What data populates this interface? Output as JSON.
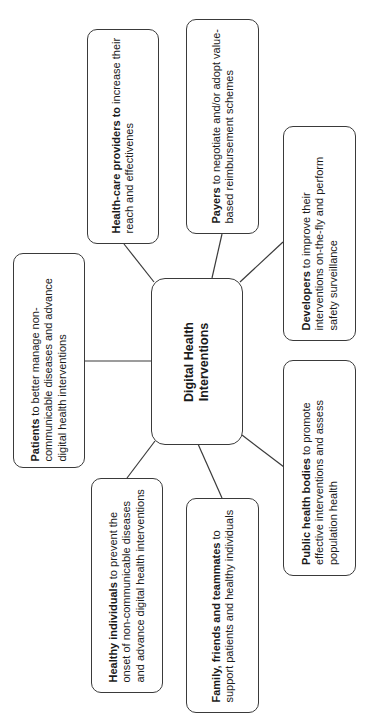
{
  "diagram": {
    "center": {
      "label": "Digital Health Interventions"
    },
    "stakeholders": [
      {
        "id": "patients",
        "bold": "Patients",
        "rest": " to better manage non-communicable diseases and advance digital health interventions"
      },
      {
        "id": "health-care-providers",
        "bold": "Health-care providers to",
        "rest": " increase their reach and effectivenes"
      },
      {
        "id": "payers",
        "bold": "Payers",
        "rest": " to negotiate and/or adopt value-based reimbursement schemes"
      },
      {
        "id": "developers",
        "bold": "Developers",
        "rest": " to improve their interventions on-the-fly and perform safety surveillance"
      },
      {
        "id": "public-health-bodies",
        "bold": "Public health bodies",
        "rest": " to promote effective interventions and assess population health"
      },
      {
        "id": "family-friends-teammates",
        "bold": "Family, friends and teammates",
        "rest": " to support patients and healthy individuals"
      },
      {
        "id": "healthy-individuals",
        "bold": "Healthy individuals",
        "rest": " to prevent the onset of non-communicable diseases and advance digital health interventions"
      }
    ],
    "colors": {
      "border": "#3a3a3a",
      "text": "#1a1a1a",
      "background": "#ffffff"
    }
  }
}
